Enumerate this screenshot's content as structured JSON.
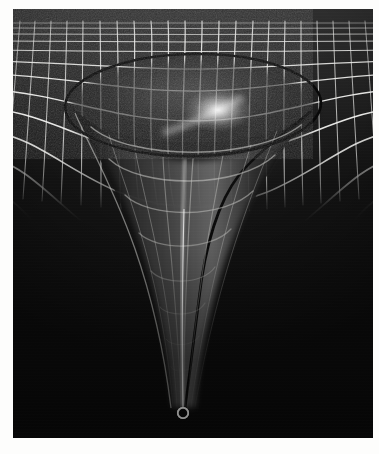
{
  "figure": {
    "caption": "",
    "medium": "grayscale-raster-illustration",
    "alt_text": "A white rectangular grid mesh stretched in perspective, dimpling downward into a deep narrow funnel; a dark ellipse outlines the rim of the depression and a small white ring marks the bottom of the throat."
  },
  "canvas": {
    "width": 379,
    "height": 454,
    "page_background": "#fdfdfc",
    "plate_left": 13,
    "plate_top": 9,
    "plate_width": 360,
    "plate_height": 429
  },
  "palette": {
    "background_dark": "#090909",
    "field_upper": "#3a3a3a",
    "field_lower": "#141414",
    "grid_line": "#f2f2f0",
    "grid_line_dim": "#9b9b98",
    "grid_line_faint": "#5e5e5c",
    "horizon_ellipse": "#050505",
    "highlight_glow": "#ffffff",
    "singularity_ring": "#f6f6f4",
    "funnel_wall": "#c9c9c6",
    "funnel_shadow": "#1a1a1a"
  },
  "scene": {
    "grid": {
      "name": "perspective-spacetime-grid",
      "columns": 26,
      "rows": 13,
      "line_width_near": 2.0,
      "line_width_far": 0.9,
      "horizon_y": 16,
      "front_edge_y": 176,
      "note": "rectangular mesh rendered in perspective, deformed by the central well"
    },
    "well": {
      "name": "gravity-well-funnel",
      "center_x": 180,
      "rim_center_y": 95,
      "rim_radius_x": 128,
      "rim_radius_y": 52,
      "throat_x": 170,
      "throat_bottom_y": 400,
      "depth_px": 305
    },
    "horizon_ellipse": {
      "name": "event-horizon-rim-outline",
      "center_x": 180,
      "center_y": 96,
      "radius_x": 128,
      "radius_y": 51,
      "stroke_width": 2.6,
      "rotation_deg": -1
    },
    "singularity": {
      "name": "singularity-marker-ring",
      "center_x": 170,
      "center_y": 404,
      "outer_radius": 5.2,
      "inner_radius": 2.6,
      "stroke_width": 1.8
    },
    "highlight": {
      "name": "specular-highlight",
      "center_x": 205,
      "center_y": 101,
      "radius_x": 34,
      "radius_y": 22
    }
  },
  "labels": {
    "none_visible": ""
  }
}
